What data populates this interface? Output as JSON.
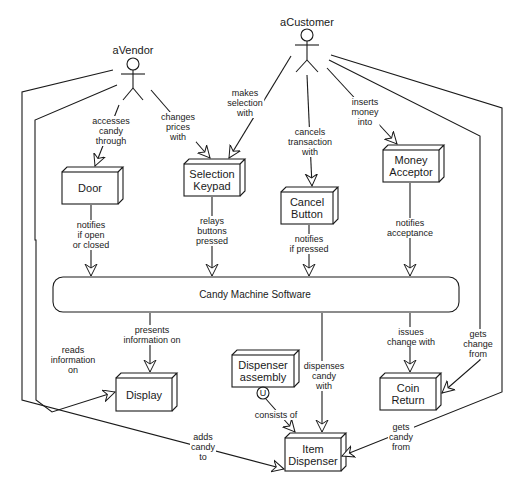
{
  "diagram": {
    "type": "uml-collaboration",
    "actors": [
      {
        "id": "vendor",
        "label": "aVendor"
      },
      {
        "id": "customer",
        "label": "aCustomer"
      }
    ],
    "nodes": {
      "door": "Door",
      "keypad": "Selection\nKeypad",
      "cancel": "Cancel\nButton",
      "money": "Money\nAcceptor",
      "software": "Candy Machine Software",
      "display": "Display",
      "assembly": "Dispenser\nassembly",
      "coin": "Coin\nReturn",
      "item": "Item\nDispenser",
      "uses_marker": "U"
    },
    "edges": {
      "vendor_door": "accesses\ncandy\nthrough",
      "vendor_keypad": "changes\nprices\nwith",
      "customer_keypad": "makes\nselection\nwith",
      "customer_cancel": "cancels\ntransaction\nwith",
      "customer_money": "inserts\nmoney\ninto",
      "door_sw": "notifies\nif open\nor closed",
      "keypad_sw": "relays\nbuttons\npressed",
      "cancel_sw": "notifies\nif pressed",
      "money_sw": "notifies\nacceptance",
      "sw_display": "presents\ninformation on",
      "vendor_display": "reads\ninformation\non",
      "sw_item": "dispenses\ncandy\nwith",
      "sw_coin": "issues\nchange with",
      "customer_coin": "gets\nchange\nfrom",
      "assembly_item": "consists of",
      "vendor_item": "adds\ncandy\nto",
      "customer_item": "gets\ncandy\nfrom"
    }
  }
}
